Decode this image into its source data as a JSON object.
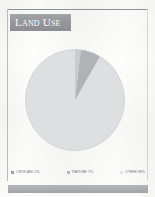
{
  "panel": {
    "title": "Land Use",
    "title_banner_color": "#939598",
    "background_color": "#fdfdfc",
    "rule_color": "#8e9094",
    "footer_bar_color": "#a9abae"
  },
  "chart_data": {
    "type": "pie",
    "title": "Land Use",
    "categories": [
      "Cropland",
      "Pasture",
      "Other"
    ],
    "values": [
      2,
      7,
      98
    ],
    "value_suffix": "%",
    "colors": [
      "#c9cbcd",
      "#b0b2b5",
      "#dedfe0"
    ],
    "legend_position": "bottom",
    "grid": false,
    "start_angle_deg": -90,
    "labels": [
      "Cropland 2%",
      "Pasture 7%",
      "Other 98%"
    ]
  },
  "legend": {
    "items": [
      {
        "label": "Cropland 2%",
        "swatch_color": "#9c9ea1"
      },
      {
        "label": "Pasture 7%",
        "swatch_color": "#b6b8bb"
      },
      {
        "label": "Other 98%",
        "swatch_color": "#e2e3e4"
      }
    ]
  }
}
